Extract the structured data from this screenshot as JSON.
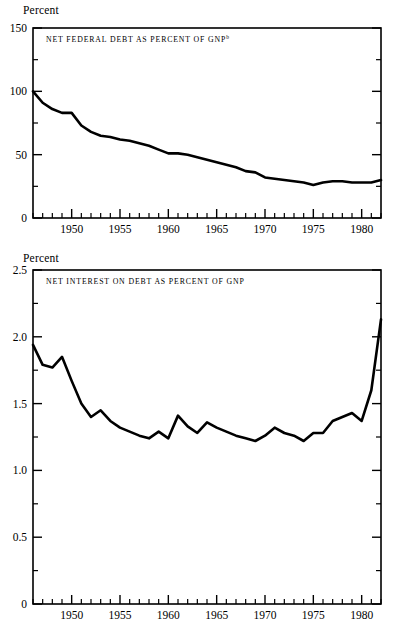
{
  "figure": {
    "background": "#ffffff",
    "line_color": "#000000",
    "axis_color": "#000000"
  },
  "panels": [
    {
      "id": "net-federal-debt",
      "unit_label": "Percent",
      "title": "NET FEDERAL DEBT AS PERCENT OF GNP",
      "title_superscript": "b",
      "ytick_labels": [
        "0",
        "50",
        "100",
        "150"
      ],
      "xtick_labels": [
        "1950",
        "1955",
        "1960",
        "1965",
        "1970",
        "1975",
        "1980"
      ]
    },
    {
      "id": "net-interest-on-debt",
      "unit_label": "Percent",
      "title": "NET INTEREST ON DEBT AS PERCENT OF GNP",
      "title_superscript": "",
      "ytick_labels": [
        "0",
        "0.5",
        "1.0",
        "1.5",
        "2.0",
        "2.5"
      ],
      "xtick_labels": [
        "1950",
        "1955",
        "1960",
        "1965",
        "1970",
        "1975",
        "1980"
      ]
    }
  ],
  "chart_data": [
    {
      "type": "line",
      "title": "NET FEDERAL DEBT AS PERCENT OF GNP",
      "title_note": "b",
      "xlabel": "",
      "ylabel": "Percent",
      "xlim": [
        1946,
        1982
      ],
      "ylim": [
        0,
        150
      ],
      "yticks": [
        0,
        25,
        50,
        75,
        100,
        125,
        150
      ],
      "ytick_labels_major": [
        0,
        50,
        100,
        150
      ],
      "xticks_major": [
        1950,
        1955,
        1960,
        1965,
        1970,
        1975,
        1980
      ],
      "xticks_minor_step": 1,
      "grid": false,
      "legend": "none",
      "x": [
        1946,
        1947,
        1948,
        1949,
        1950,
        1951,
        1952,
        1953,
        1954,
        1955,
        1956,
        1957,
        1958,
        1959,
        1960,
        1961,
        1962,
        1963,
        1964,
        1965,
        1966,
        1967,
        1968,
        1969,
        1970,
        1971,
        1972,
        1973,
        1974,
        1975,
        1976,
        1977,
        1978,
        1979,
        1980,
        1981,
        1982
      ],
      "values": [
        100,
        91,
        86,
        83,
        83,
        73,
        68,
        65,
        64,
        62,
        61,
        59,
        57,
        54,
        51,
        51,
        50,
        48,
        46,
        44,
        42,
        40,
        37,
        36,
        32,
        31,
        30,
        29,
        28,
        26,
        28,
        29,
        29,
        28,
        28,
        28,
        30
      ],
      "series": [
        {
          "name": "Net federal debt as percent of GNP",
          "values": [
            100,
            91,
            86,
            83,
            83,
            73,
            68,
            65,
            64,
            62,
            61,
            59,
            57,
            54,
            51,
            51,
            50,
            48,
            46,
            44,
            42,
            40,
            37,
            36,
            32,
            31,
            30,
            29,
            28,
            26,
            28,
            29,
            29,
            28,
            28,
            28,
            30
          ]
        }
      ]
    },
    {
      "type": "line",
      "title": "NET INTEREST ON DEBT AS PERCENT OF GNP",
      "title_note": "",
      "xlabel": "",
      "ylabel": "Percent",
      "xlim": [
        1946,
        1982
      ],
      "ylim": [
        0,
        2.5
      ],
      "yticks": [
        0,
        0.25,
        0.5,
        0.75,
        1.0,
        1.25,
        1.5,
        1.75,
        2.0,
        2.25,
        2.5
      ],
      "ytick_labels_major": [
        0,
        0.5,
        1.0,
        1.5,
        2.0,
        2.5
      ],
      "xticks_major": [
        1950,
        1955,
        1960,
        1965,
        1970,
        1975,
        1980
      ],
      "xticks_minor_step": 1,
      "grid": false,
      "legend": "none",
      "x": [
        1946,
        1947,
        1948,
        1949,
        1950,
        1951,
        1952,
        1953,
        1954,
        1955,
        1956,
        1957,
        1958,
        1959,
        1960,
        1961,
        1962,
        1963,
        1964,
        1965,
        1966,
        1967,
        1968,
        1969,
        1970,
        1971,
        1972,
        1973,
        1974,
        1975,
        1976,
        1977,
        1978,
        1979,
        1980,
        1981,
        1982
      ],
      "values": [
        1.94,
        1.79,
        1.77,
        1.85,
        1.67,
        1.5,
        1.4,
        1.45,
        1.37,
        1.32,
        1.29,
        1.26,
        1.24,
        1.29,
        1.24,
        1.41,
        1.33,
        1.28,
        1.36,
        1.32,
        1.29,
        1.26,
        1.24,
        1.22,
        1.26,
        1.32,
        1.28,
        1.26,
        1.22,
        1.28,
        1.28,
        1.37,
        1.4,
        1.43,
        1.37,
        1.6,
        2.13
      ],
      "series": [
        {
          "name": "Net interest on debt as percent of GNP",
          "values": [
            1.94,
            1.79,
            1.77,
            1.85,
            1.67,
            1.5,
            1.4,
            1.45,
            1.37,
            1.32,
            1.29,
            1.26,
            1.24,
            1.29,
            1.24,
            1.41,
            1.33,
            1.28,
            1.36,
            1.32,
            1.29,
            1.26,
            1.24,
            1.22,
            1.26,
            1.32,
            1.28,
            1.26,
            1.22,
            1.28,
            1.28,
            1.37,
            1.4,
            1.43,
            1.37,
            1.6,
            2.13
          ]
        }
      ]
    }
  ]
}
